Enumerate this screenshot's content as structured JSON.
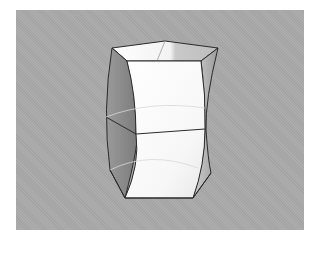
{
  "figure": {
    "colors": {
      "background": "#ffffff",
      "panel": "#a9a9a9",
      "edge": "#2a2a2a",
      "face_light": "#fdfdfd",
      "face_mid": "#e6e6e6",
      "face_dark": "#8f8f8f",
      "face_shadow": "#7d7d7d"
    }
  }
}
